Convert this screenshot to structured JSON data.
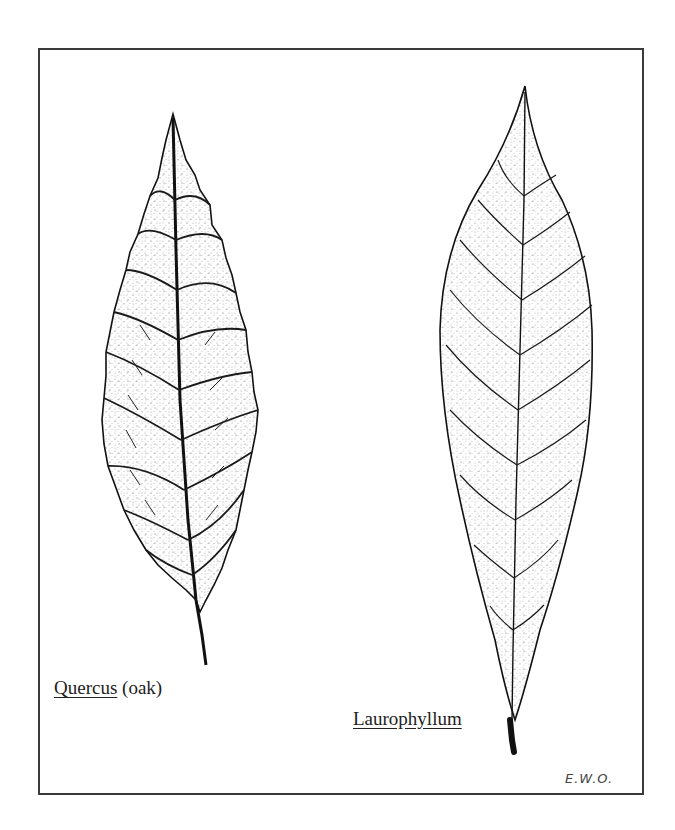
{
  "figure": {
    "leaves": [
      {
        "id": "quercus",
        "genus": "Quercus",
        "common_name": "(oak)"
      },
      {
        "id": "laurophyllum",
        "genus": "Laurophyllum",
        "common_name": ""
      }
    ],
    "signature": "E.W.O.",
    "colors": {
      "ink": "#222222",
      "paper": "#ffffff",
      "frame": "#3a3a3a"
    }
  }
}
